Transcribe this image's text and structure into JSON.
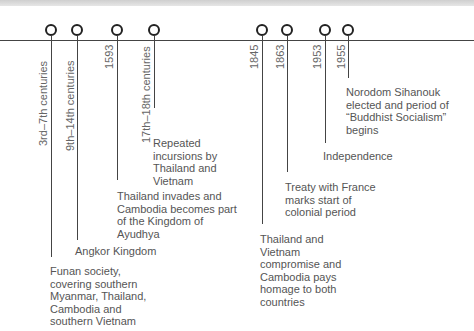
{
  "timeline": {
    "events": [
      {
        "date": "3rd–7th centuries",
        "description": "Funan society, covering southern Myanmar, Thailand, Cambodia and southern Vietnam"
      },
      {
        "date": "9th–14th centuries",
        "description": "Angkor Kingdom"
      },
      {
        "date": "1593",
        "description": "Thailand invades and Cambodia becomes part of the Kingdom of Ayudhya"
      },
      {
        "date": "17th–18th centuries",
        "description": "Repeated incursions by Thailand and Vietnam"
      },
      {
        "date": "1845",
        "description": "Thailand and Vietnam compromise and Cambodia pays homage to both countries"
      },
      {
        "date": "1863",
        "description": "Treaty with France marks start of colonial period"
      },
      {
        "date": "1953",
        "description": "Independence"
      },
      {
        "date": "1955",
        "description": "Norodom Sihanouk elected and period of “Buddhist Socialism” begins"
      }
    ]
  },
  "colors": {
    "line": "#444444",
    "marker": "#222222",
    "text": "#555555"
  }
}
